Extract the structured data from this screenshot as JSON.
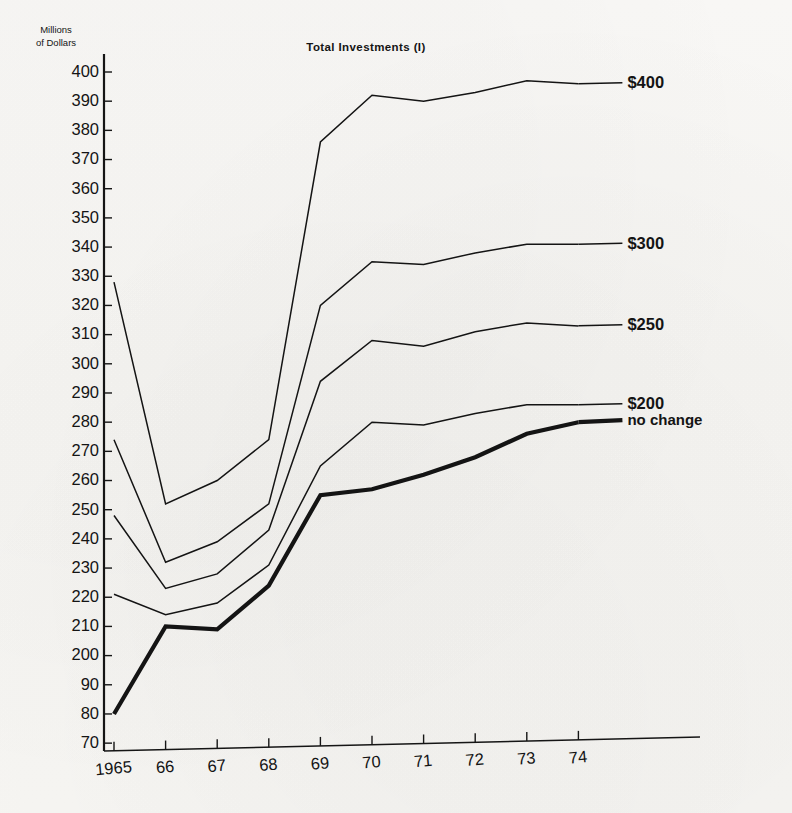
{
  "chart_data": {
    "type": "line",
    "title": "Total Investments (I)",
    "xlabel": "",
    "ylabel": "Millions of Dollars",
    "ylabel_line1": "Millions",
    "ylabel_line2": "of Dollars",
    "x": [
      "1965",
      "66",
      "67",
      "68",
      "69",
      "70",
      "71",
      "72",
      "73",
      "74"
    ],
    "xtick_labels": [
      "1965",
      "66",
      "67",
      "68",
      "69",
      "70",
      "71",
      "72",
      "73",
      "74"
    ],
    "ytick_labels": [
      "400",
      "390",
      "380",
      "370",
      "360",
      "350",
      "340",
      "330",
      "320",
      "310",
      "300",
      "290",
      "280",
      "270",
      "260",
      "250",
      "240",
      "230",
      "220",
      "210",
      "200",
      "90",
      "80",
      "70"
    ],
    "ytick_values": [
      400,
      390,
      380,
      370,
      360,
      350,
      340,
      330,
      320,
      310,
      300,
      290,
      280,
      270,
      260,
      250,
      240,
      230,
      220,
      210,
      200,
      190,
      180,
      170
    ],
    "ylim": [
      163,
      405
    ],
    "xlim": [
      0,
      9
    ],
    "grid": false,
    "legend_position": "right-inline-labels",
    "series": [
      {
        "name": "$400",
        "label": "$400",
        "style": "thin",
        "values": [
          328,
          252,
          260,
          274,
          376,
          392,
          390,
          393,
          397,
          396
        ]
      },
      {
        "name": "$300",
        "label": "$300",
        "style": "thin",
        "values": [
          274,
          232,
          239,
          252,
          320,
          335,
          334,
          338,
          341,
          341
        ]
      },
      {
        "name": "$250",
        "label": "$250",
        "style": "thin",
        "values": [
          248,
          223,
          228,
          243,
          294,
          308,
          306,
          311,
          314,
          313
        ]
      },
      {
        "name": "$200",
        "label": "$200",
        "style": "thin",
        "values": [
          221,
          214,
          218,
          231,
          265,
          280,
          279,
          283,
          286,
          286
        ]
      },
      {
        "name": "no change",
        "label": "no change",
        "style": "bold",
        "values": [
          180,
          210,
          209,
          224,
          255,
          257,
          262,
          268,
          276,
          280
        ]
      }
    ]
  }
}
